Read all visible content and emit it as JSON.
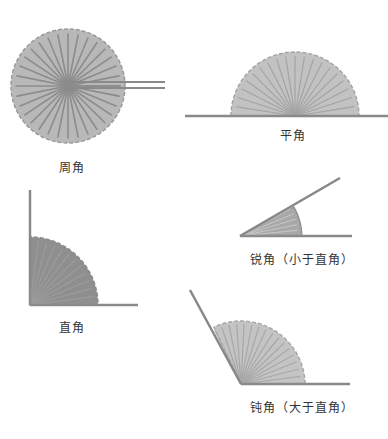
{
  "colors": {
    "fan_fill": "#b5b5b5",
    "fan_fill_dark": "#8e8e8e",
    "fan_rib": "#8a8a8a",
    "line": "#888888",
    "text": "#333333",
    "background": "#ffffff"
  },
  "angles": [
    {
      "id": "full",
      "label": "周角",
      "degrees": 360
    },
    {
      "id": "straight",
      "label": "平角",
      "degrees": 180
    },
    {
      "id": "right",
      "label": "直角",
      "degrees": 90
    },
    {
      "id": "acute",
      "label": "锐角（小于直角）",
      "degrees": 30
    },
    {
      "id": "obtuse",
      "label": "钝角（大于直角）",
      "degrees": 120
    }
  ]
}
